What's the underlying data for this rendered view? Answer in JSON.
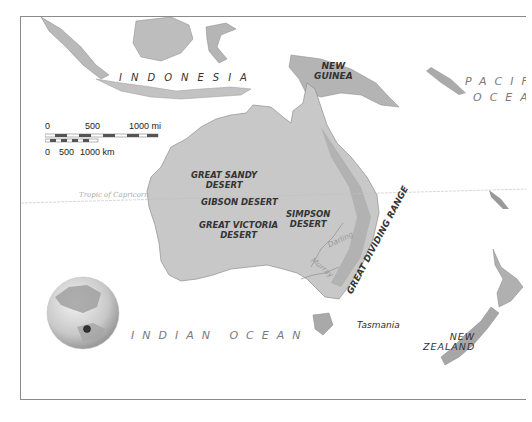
{
  "map": {
    "title": "Australia and Oceania",
    "labels": {
      "indonesia": "INDONESIA",
      "new_guinea_line1": "NEW",
      "new_guinea_line2": "GUINEA",
      "pacific_line1": "PACIFIC",
      "pacific_line2": "OCEAN",
      "indian_ocean": "INDIAN OCEAN",
      "tropic": "Tropic of Capricorn",
      "great_sandy_line1": "GREAT SANDY",
      "great_sandy_line2": "DESERT",
      "gibson": "GIBSON DESERT",
      "great_victoria_line1": "GREAT VICTORIA",
      "great_victoria_line2": "DESERT",
      "simpson_line1": "SIMPSON",
      "simpson_line2": "DESERT",
      "great_dividing_range": "GREAT DIVIDING RANGE",
      "darling": "Darling",
      "murray": "Murray",
      "tasmania": "Tasmania",
      "new_zealand_line1": "NEW",
      "new_zealand_line2": "ZEALAND"
    },
    "scale_bar": {
      "miles": {
        "ticks": [
          "0",
          "500",
          "1000 mi"
        ]
      },
      "km": {
        "ticks": [
          "0",
          "500",
          "1000 km"
        ]
      }
    },
    "locator_globe": {
      "marker": "Australia"
    },
    "colors": {
      "land": "#c9c9c9",
      "land_dark": "#9e9e9e",
      "ocean": "#ffffff",
      "frame": "#8a8a8a",
      "label": "#2a2a2a",
      "ocean_label": "#7a7a7a"
    }
  }
}
